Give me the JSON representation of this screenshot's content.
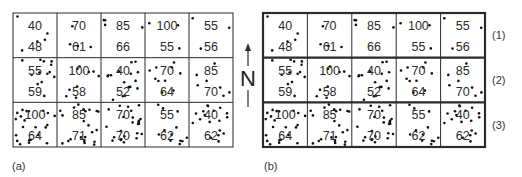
{
  "panels": [
    {
      "id": "a",
      "label": "(a)",
      "rows": [
        [
          {
            "top": "40",
            "bottom": "48",
            "dots": 5
          },
          {
            "top": "70",
            "bottom": "61",
            "dots": 4
          },
          {
            "top": "85",
            "bottom": "66",
            "dots": 4
          },
          {
            "top": "100",
            "bottom": "55",
            "dots": 3
          },
          {
            "top": "55",
            "bottom": "56",
            "dots": 3
          }
        ],
        [
          {
            "top": "55",
            "bottom": "59",
            "dots": 13
          },
          {
            "top": "100",
            "bottom": "58",
            "dots": 9
          },
          {
            "top": "40",
            "bottom": "52",
            "dots": 16
          },
          {
            "top": "70",
            "bottom": "64",
            "dots": 10
          },
          {
            "top": "85",
            "bottom": "70",
            "dots": 7
          }
        ],
        [
          {
            "top": "100",
            "bottom": "64",
            "dots": 22
          },
          {
            "top": "85",
            "bottom": "71",
            "dots": 22
          },
          {
            "top": "70",
            "bottom": "70",
            "dots": 24
          },
          {
            "top": "55",
            "bottom": "62",
            "dots": 12
          },
          {
            "top": "40",
            "bottom": "62",
            "dots": 18
          }
        ]
      ],
      "row_labels": []
    },
    {
      "id": "b",
      "label": "(b)",
      "rows": [
        [
          {
            "top": "40",
            "bottom": "48",
            "dots": 5
          },
          {
            "top": "70",
            "bottom": "61",
            "dots": 4
          },
          {
            "top": "85",
            "bottom": "66",
            "dots": 4
          },
          {
            "top": "100",
            "bottom": "55",
            "dots": 3
          },
          {
            "top": "55",
            "bottom": "56",
            "dots": 3
          }
        ],
        [
          {
            "top": "55",
            "bottom": "59",
            "dots": 13
          },
          {
            "top": "100",
            "bottom": "58",
            "dots": 9
          },
          {
            "top": "40",
            "bottom": "52",
            "dots": 16
          },
          {
            "top": "70",
            "bottom": "64",
            "dots": 10
          },
          {
            "top": "85",
            "bottom": "70",
            "dots": 7
          }
        ],
        [
          {
            "top": "100",
            "bottom": "64",
            "dots": 22
          },
          {
            "top": "85",
            "bottom": "71",
            "dots": 22
          },
          {
            "top": "70",
            "bottom": "70",
            "dots": 24
          },
          {
            "top": "55",
            "bottom": "62",
            "dots": 12
          },
          {
            "top": "40",
            "bottom": "62",
            "dots": 18
          }
        ]
      ],
      "row_labels": [
        "(1)",
        "(2)",
        "(3)"
      ]
    }
  ],
  "north_arrow": {
    "label": "N",
    "icon": "north-arrow-icon"
  },
  "colors": {
    "line": "#2b2b2b",
    "dot": "#111111",
    "text": "#2a2a2a"
  }
}
